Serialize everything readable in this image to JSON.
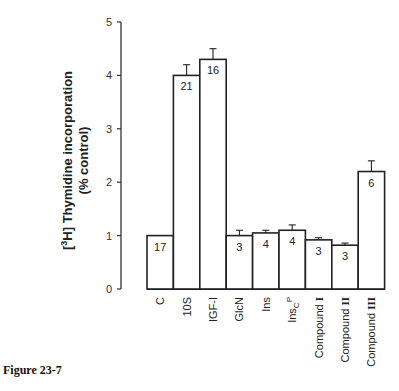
{
  "chart_data": {
    "type": "bar",
    "title": "",
    "xlabel": "",
    "ylabel": "[3H] Thymidine incorporation (% control)",
    "ylabel_lines": [
      "[3H] Thymidine incorporation",
      "(% control)"
    ],
    "ylim": [
      0,
      5
    ],
    "yticks": [
      0,
      1,
      2,
      3,
      4,
      5
    ],
    "grid": false,
    "legend": null,
    "categories": [
      "C",
      "10S",
      "IGF-I",
      "GlcN",
      "Ins",
      "InscP",
      "Compound I",
      "Compound II",
      "Compound III"
    ],
    "category_display": [
      {
        "main": "C",
        "sub": "",
        "sup": ""
      },
      {
        "main": "10S",
        "sub": "",
        "sup": ""
      },
      {
        "main": "IGF-I",
        "sub": "",
        "sup": ""
      },
      {
        "main": "GlcN",
        "sub": "",
        "sup": ""
      },
      {
        "main": "Ins",
        "sub": "",
        "sup": ""
      },
      {
        "main": "Ins",
        "sub": "C",
        "sup": "P"
      },
      {
        "main": "Compound ",
        "bold": "I"
      },
      {
        "main": "Compound ",
        "bold": "II"
      },
      {
        "main": "Compound ",
        "bold": "III"
      }
    ],
    "values": [
      1.0,
      4.0,
      4.3,
      1.0,
      1.05,
      1.1,
      0.92,
      0.82,
      2.2
    ],
    "errors": [
      0,
      0.2,
      0.2,
      0.1,
      0.05,
      0.1,
      0.04,
      0.04,
      0.2
    ],
    "n_labels": [
      "17",
      "21",
      "16",
      "3",
      "4",
      "4",
      "3",
      "3",
      "6"
    ]
  },
  "figure": {
    "caption": "Figure 23-7"
  }
}
